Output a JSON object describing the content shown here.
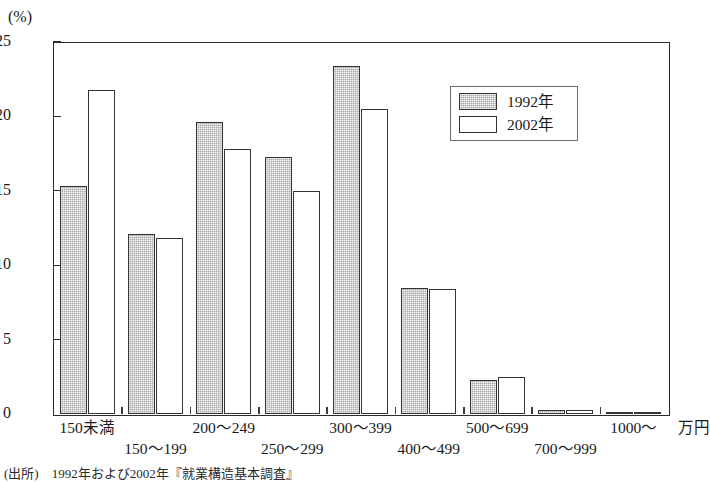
{
  "chart_data": {
    "type": "bar",
    "title": "",
    "subtitle": "",
    "unit_label": "(%)",
    "xlabel": "万円",
    "ylabel": "(%)",
    "ylim": [
      0,
      25
    ],
    "yticks": [
      0,
      5,
      10,
      15,
      20,
      25
    ],
    "ytick_labels": [
      "0",
      "5",
      "10",
      "15",
      "20",
      "25"
    ],
    "grid": false,
    "legend_position": "upper-right",
    "categories": [
      "150未満",
      "150〜199",
      "200〜249",
      "250〜299",
      "300〜399",
      "400〜499",
      "500〜699",
      "700〜999",
      "1000〜"
    ],
    "series": [
      {
        "name": "1992年",
        "color": "#a8a8a8",
        "values": [
          15.3,
          12.1,
          19.6,
          17.3,
          23.4,
          8.5,
          2.3,
          0.3,
          0.05
        ]
      },
      {
        "name": "2002年",
        "color": "#ffffff",
        "values": [
          21.8,
          11.8,
          17.8,
          15.0,
          20.5,
          8.4,
          2.5,
          0.3,
          0.05
        ]
      }
    ]
  },
  "legend": {
    "entries": [
      {
        "label": "1992年",
        "swatch": "filled-gray"
      },
      {
        "label": "2002年",
        "swatch": "outline-white"
      }
    ]
  },
  "axis": {
    "unit_label": "(%)",
    "x_unit": "万円",
    "x_labels": [
      "150未満",
      "150〜199",
      "200〜249",
      "250〜299",
      "300〜399",
      "400〜499",
      "500〜699",
      "700〜999",
      "1000〜"
    ],
    "y_labels": [
      "25",
      "20",
      "15",
      "10",
      "5",
      "0"
    ]
  },
  "source_note": "(出所)　1992年および2002年『就業構造基本調査』"
}
